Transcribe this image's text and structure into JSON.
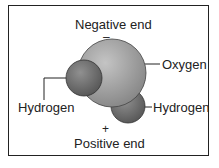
{
  "diagram": {
    "labels": {
      "negative_end": "Negative end",
      "negative_sign": "–",
      "oxygen": "Oxygen",
      "hydrogen_left": "Hydrogen",
      "hydrogen_right": "Hydrogen",
      "positive_sign": "+",
      "positive_end": "Positive end"
    },
    "colors": {
      "oxygen": "#9a9a9a",
      "hydrogen": "#707070",
      "border": "#222222",
      "text": "#222222"
    }
  }
}
